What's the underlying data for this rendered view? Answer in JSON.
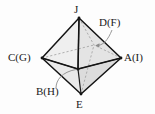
{
  "figure": {
    "shape_name": "octahedron",
    "colors": {
      "background": "#fdfdfd",
      "edge_solid": "#1a1a1a",
      "edge_hidden": "#9a9a9a",
      "face_light": "#f2f2f2",
      "face_mid": "#e6e6e6",
      "face_dark": "#d8d8d8",
      "label_text": "#1a1a1a",
      "leader_line": "#8c8c8c"
    },
    "labels": {
      "top": "J",
      "back": "D(F)",
      "left": "C(G)",
      "right": "A(I)",
      "front": "B(H)",
      "bottom": "E"
    },
    "vertices": {
      "top": {
        "id": "J",
        "x": 79,
        "y": 18
      },
      "bottom": {
        "id": "E",
        "x": 81,
        "y": 94
      },
      "left": {
        "id": "C(G)",
        "x": 42,
        "y": 58
      },
      "right": {
        "id": "A(I)",
        "x": 121,
        "y": 58
      },
      "front": {
        "id": "B(H)",
        "x": 78,
        "y": 69
      },
      "back": {
        "id": "D(F)",
        "x": 94,
        "y": 45
      }
    }
  }
}
